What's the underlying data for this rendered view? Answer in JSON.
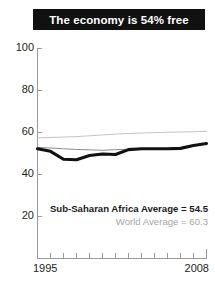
{
  "title": "The economy is 54% free",
  "colors": {
    "banner_bg": "#111111",
    "banner_text": "#ffffff",
    "africa_line": "#111111",
    "region_line": "#8c8c8c",
    "world_line": "#c4c4c4",
    "axis": "#9a9a9a",
    "tick_text": "#231f20",
    "legend_world_text": "#a6a6a6"
  },
  "axis": {
    "y_ticks": [
      "100",
      "80",
      "60",
      "40",
      "20"
    ],
    "y_tick_values": [
      100,
      80,
      60,
      40,
      20
    ],
    "x_start_label": "1995",
    "x_end_label": "2008"
  },
  "legend": {
    "africa": "Sub-Saharan Africa Average = 54.5",
    "world": "World Average = 60.3"
  },
  "chart_data": {
    "type": "line",
    "title": "The economy is 54% free",
    "xlabel": "",
    "ylabel": "",
    "xlim": [
      1995,
      2008
    ],
    "ylim": [
      0,
      100
    ],
    "ytick_values": [
      20,
      40,
      60,
      80,
      100
    ],
    "grid": false,
    "legend_position": "inside-bottom-right",
    "x": [
      1995,
      1996,
      1997,
      1998,
      1999,
      2000,
      2001,
      2002,
      2003,
      2004,
      2005,
      2006,
      2007,
      2008
    ],
    "series": [
      {
        "name": "Sub-Saharan Africa Average",
        "label": "Sub-Saharan Africa Average = 54.5",
        "color": "#111111",
        "width": "thick",
        "final_value": 54.5,
        "values": [
          52.0,
          50.8,
          47.0,
          46.8,
          48.8,
          49.5,
          49.3,
          51.6,
          52.0,
          52.0,
          52.0,
          52.2,
          53.6,
          54.5
        ]
      },
      {
        "name": "Regional reference",
        "label": "",
        "color": "#8c8c8c",
        "width": "thin",
        "final_value": 54.5,
        "values": [
          52.6,
          52.4,
          52.0,
          51.7,
          51.5,
          51.3,
          51.6,
          51.8,
          52.0,
          52.0,
          52.1,
          52.3,
          53.4,
          54.3
        ]
      },
      {
        "name": "World Average",
        "label": "World Average = 60.3",
        "color": "#c4c4c4",
        "width": "thin",
        "final_value": 60.3,
        "values": [
          57.2,
          57.4,
          57.6,
          57.8,
          58.2,
          58.6,
          59.0,
          59.3,
          59.5,
          59.7,
          59.9,
          60.0,
          60.1,
          60.3
        ]
      }
    ]
  }
}
